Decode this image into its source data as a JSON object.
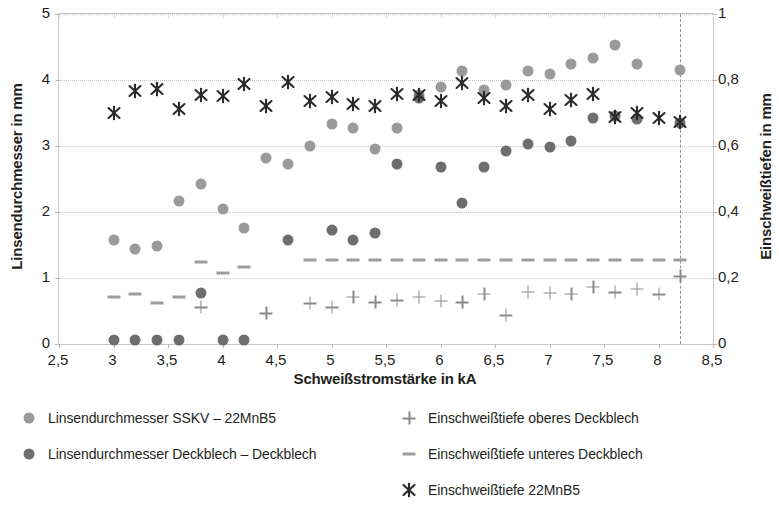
{
  "chart_data": {
    "type": "scatter",
    "title": "",
    "xlabel": "Schweißstromstärke in kA",
    "ylabel": "Linsendurchmesser in mm",
    "ylabel_right": "Einschweißtiefen in mm",
    "xlim": [
      2.5,
      8.5
    ],
    "ylim": [
      0,
      5
    ],
    "ylim_right": [
      0,
      1
    ],
    "xticks": [
      "2,5",
      "3",
      "3,5",
      "4",
      "4,5",
      "5",
      "5,5",
      "6",
      "6,5",
      "7",
      "7,5",
      "8",
      "8,5"
    ],
    "xtick_values": [
      2.5,
      3,
      3.5,
      4,
      4.5,
      5,
      5.5,
      6,
      6.5,
      7,
      7.5,
      8,
      8.5
    ],
    "yticks": [
      "0",
      "1",
      "2",
      "3",
      "4",
      "5"
    ],
    "ytick_values": [
      0,
      1,
      2,
      3,
      4,
      5
    ],
    "yticks_right": [
      "0",
      "0,2",
      "0,4",
      "0,6",
      "0,8",
      "1"
    ],
    "ytick_values_right": [
      0,
      0.2,
      0.4,
      0.6,
      0.8,
      1.0
    ],
    "grid": true,
    "legend_position": "below",
    "annotations": [
      {
        "type": "vline",
        "x": 8.2,
        "style": "dashed"
      }
    ],
    "series": [
      {
        "name": "Linsendurchmesser SSKV – 22MnB5",
        "marker": "circle-light",
        "color": "#9a9a9a",
        "axis": "left",
        "points": [
          [
            3.0,
            1.58
          ],
          [
            3.2,
            1.44
          ],
          [
            3.4,
            1.49
          ],
          [
            3.6,
            2.17
          ],
          [
            3.8,
            2.43
          ],
          [
            4.0,
            2.04
          ],
          [
            4.2,
            1.76
          ],
          [
            4.4,
            2.82
          ],
          [
            4.6,
            2.72
          ],
          [
            4.8,
            3.0
          ],
          [
            5.0,
            3.33
          ],
          [
            5.2,
            3.27
          ],
          [
            5.4,
            2.96
          ],
          [
            5.6,
            3.27
          ],
          [
            5.8,
            3.78
          ],
          [
            6.0,
            3.9
          ],
          [
            6.2,
            4.13
          ],
          [
            6.4,
            3.85
          ],
          [
            6.6,
            3.93
          ],
          [
            6.8,
            4.14
          ],
          [
            7.0,
            4.09
          ],
          [
            7.2,
            4.24
          ],
          [
            7.4,
            4.34
          ],
          [
            7.6,
            4.53
          ],
          [
            7.8,
            4.25
          ],
          [
            8.2,
            4.15
          ]
        ]
      },
      {
        "name": "Linsendurchmesser Deckblech – Deckblech",
        "marker": "circle-dark",
        "color": "#6e6e6e",
        "axis": "left",
        "points": [
          [
            3.0,
            0.06
          ],
          [
            3.2,
            0.06
          ],
          [
            3.4,
            0.06
          ],
          [
            3.6,
            0.06
          ],
          [
            3.8,
            0.78
          ],
          [
            4.0,
            0.06
          ],
          [
            4.2,
            0.06
          ],
          [
            4.6,
            1.58
          ],
          [
            5.0,
            1.73
          ],
          [
            5.2,
            1.58
          ],
          [
            5.4,
            1.68
          ],
          [
            5.6,
            2.72
          ],
          [
            5.8,
            3.73
          ],
          [
            6.0,
            2.68
          ],
          [
            6.2,
            2.14
          ],
          [
            6.4,
            2.68
          ],
          [
            6.6,
            2.92
          ],
          [
            6.8,
            3.03
          ],
          [
            7.0,
            2.99
          ],
          [
            7.2,
            3.08
          ],
          [
            7.4,
            3.42
          ],
          [
            7.6,
            3.45
          ],
          [
            7.8,
            3.41
          ],
          [
            8.2,
            3.35
          ]
        ]
      },
      {
        "name": "Einschweißtiefe oberes Deckblech",
        "marker": "plus",
        "color": "#8a8a8a",
        "axis": "right",
        "points": [
          [
            3.8,
            0.112
          ],
          [
            4.4,
            0.094
          ],
          [
            4.8,
            0.124
          ],
          [
            5.0,
            0.112
          ],
          [
            5.2,
            0.143
          ],
          [
            5.4,
            0.126
          ],
          [
            5.6,
            0.133
          ],
          [
            5.8,
            0.143
          ],
          [
            6.0,
            0.131
          ],
          [
            6.2,
            0.126
          ],
          [
            6.4,
            0.153
          ],
          [
            6.6,
            0.088
          ],
          [
            6.8,
            0.158
          ],
          [
            7.0,
            0.155
          ],
          [
            7.2,
            0.153
          ],
          [
            7.4,
            0.174
          ],
          [
            7.6,
            0.157
          ],
          [
            7.8,
            0.168
          ],
          [
            8.0,
            0.151
          ],
          [
            8.2,
            0.205
          ]
        ]
      },
      {
        "name": "Einschweißtiefe unteres Deckblech",
        "marker": "dash",
        "color": "#9d9d9d",
        "axis": "right",
        "points": [
          [
            3.0,
            0.141
          ],
          [
            3.2,
            0.152
          ],
          [
            3.4,
            0.125
          ],
          [
            3.6,
            0.143
          ],
          [
            3.8,
            0.25
          ],
          [
            4.0,
            0.215
          ],
          [
            4.2,
            0.232
          ],
          [
            4.8,
            0.255
          ],
          [
            5.0,
            0.254
          ],
          [
            5.2,
            0.254
          ],
          [
            5.4,
            0.255
          ],
          [
            5.6,
            0.255
          ],
          [
            5.8,
            0.254
          ],
          [
            6.0,
            0.254
          ],
          [
            6.2,
            0.254
          ],
          [
            6.4,
            0.255
          ],
          [
            6.6,
            0.255
          ],
          [
            6.8,
            0.255
          ],
          [
            7.0,
            0.255
          ],
          [
            7.2,
            0.255
          ],
          [
            7.4,
            0.255
          ],
          [
            7.6,
            0.255
          ],
          [
            7.8,
            0.255
          ],
          [
            8.0,
            0.255
          ],
          [
            8.2,
            0.255
          ]
        ]
      },
      {
        "name": "Einschweißtiefe 22MnB5",
        "marker": "x",
        "color": "#2b2b2b",
        "axis": "right",
        "points": [
          [
            3.0,
            0.7
          ],
          [
            3.2,
            0.768
          ],
          [
            3.4,
            0.772
          ],
          [
            3.6,
            0.712
          ],
          [
            3.8,
            0.755
          ],
          [
            4.0,
            0.752
          ],
          [
            4.2,
            0.788
          ],
          [
            4.4,
            0.722
          ],
          [
            4.6,
            0.793
          ],
          [
            4.8,
            0.735
          ],
          [
            5.0,
            0.747
          ],
          [
            5.2,
            0.728
          ],
          [
            5.4,
            0.722
          ],
          [
            5.6,
            0.757
          ],
          [
            5.8,
            0.755
          ],
          [
            6.0,
            0.735
          ],
          [
            6.2,
            0.79
          ],
          [
            6.4,
            0.746
          ],
          [
            6.6,
            0.722
          ],
          [
            6.8,
            0.756
          ],
          [
            7.0,
            0.712
          ],
          [
            7.2,
            0.74
          ],
          [
            7.4,
            0.757
          ],
          [
            7.6,
            0.688
          ],
          [
            7.8,
            0.7
          ],
          [
            8.0,
            0.686
          ],
          [
            8.2,
            0.672
          ]
        ]
      }
    ],
    "legend": [
      {
        "label": "Linsendurchmesser SSKV – 22MnB5",
        "marker": "circle-light",
        "col": 0,
        "row": 0
      },
      {
        "label": "Linsendurchmesser Deckblech – Deckblech",
        "marker": "circle-dark",
        "col": 0,
        "row": 1
      },
      {
        "label": "Einschweißtiefe oberes Deckblech",
        "marker": "plus",
        "col": 1,
        "row": 0
      },
      {
        "label": "Einschweißtiefe unteres Deckblech",
        "marker": "dash",
        "col": 1,
        "row": 1
      },
      {
        "label": "Einschweißtiefe 22MnB5",
        "marker": "x",
        "col": 1,
        "row": 2
      }
    ]
  }
}
